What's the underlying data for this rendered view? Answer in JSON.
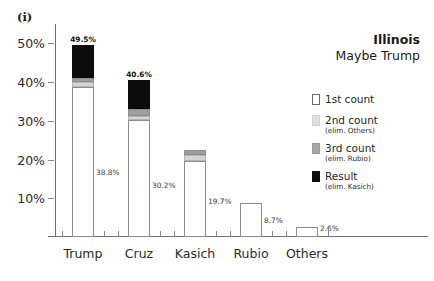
{
  "panel_marker": "(i)",
  "chart_data": {
    "type": "bar",
    "title": "Illinois",
    "subtitle": "Maybe Trump",
    "xlabel": "",
    "ylabel": "",
    "ylim": [
      0,
      55
    ],
    "grid": false,
    "stacked": true,
    "legend_position": "right",
    "categories": [
      "Trump",
      "Cruz",
      "Kasich",
      "Rubio",
      "Others"
    ],
    "ytick_labels": [
      "50%",
      "40%",
      "30%",
      "20%",
      "10%"
    ],
    "ytick_values": [
      50,
      40,
      30,
      20,
      10
    ],
    "series": [
      {
        "name": "1st count",
        "values": [
          38.8,
          30.2,
          19.7,
          8.7,
          2.6
        ]
      },
      {
        "name": "2nd count",
        "values": [
          40.0,
          31.3,
          21.3,
          null,
          null
        ]
      },
      {
        "name": "3rd count",
        "values": [
          41.0,
          33.0,
          22.4,
          null,
          null
        ]
      },
      {
        "name": "Result",
        "values": [
          49.5,
          40.6,
          null,
          null,
          null
        ]
      }
    ],
    "bars": [
      {
        "category": "Trump",
        "top_label": "49.5%",
        "inner_label": "38.8%",
        "segments": [
          {
            "series": "1st count",
            "from": 0.0,
            "to": 38.8
          },
          {
            "series": "2nd count",
            "from": 38.8,
            "to": 40.0
          },
          {
            "series": "3rd count",
            "from": 40.0,
            "to": 41.0
          },
          {
            "series": "Result",
            "from": 41.0,
            "to": 49.5
          }
        ]
      },
      {
        "category": "Cruz",
        "top_label": "40.6%",
        "inner_label": "30.2%",
        "segments": [
          {
            "series": "1st count",
            "from": 0.0,
            "to": 30.2
          },
          {
            "series": "2nd count",
            "from": 30.2,
            "to": 31.3
          },
          {
            "series": "3rd count",
            "from": 31.3,
            "to": 33.0
          },
          {
            "series": "Result",
            "from": 33.0,
            "to": 40.6
          }
        ]
      },
      {
        "category": "Kasich",
        "top_label": "",
        "inner_label": "19.7%",
        "segments": [
          {
            "series": "1st count",
            "from": 0.0,
            "to": 19.7
          },
          {
            "series": "2nd count",
            "from": 19.7,
            "to": 21.3
          },
          {
            "series": "3rd count",
            "from": 21.3,
            "to": 22.4
          }
        ]
      },
      {
        "category": "Rubio",
        "top_label": "",
        "inner_label": "8.7%",
        "segments": [
          {
            "series": "1st count",
            "from": 0.0,
            "to": 8.7
          }
        ]
      },
      {
        "category": "Others",
        "top_label": "",
        "inner_label": "2.6%",
        "segments": [
          {
            "series": "1st count",
            "from": 0.0,
            "to": 2.6
          }
        ]
      }
    ],
    "legend": [
      {
        "name": "1st count",
        "sub": "",
        "swatch": "#ffffff"
      },
      {
        "name": "2nd count",
        "sub": "(elim. Others)",
        "swatch": "#e0e0e0"
      },
      {
        "name": "3rd count",
        "sub": "(elim. Rubio)",
        "swatch": "#a6a6a6"
      },
      {
        "name": "Result",
        "sub": "(elim. Kasich)",
        "swatch": "#0c0c0c"
      }
    ]
  }
}
